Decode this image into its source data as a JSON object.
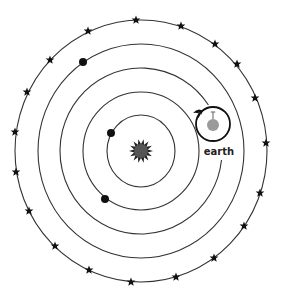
{
  "diagram": {
    "center": {
      "x": 141,
      "y": 151
    },
    "colors": {
      "line": "#333333",
      "star": "#111111",
      "sun": "#555555",
      "earth_planet": "#9a9a9a",
      "background": "#ffffff"
    },
    "earth_label": "earth",
    "orbits": [
      {
        "name": "orbit-1",
        "rx": 34,
        "ry": 36
      },
      {
        "name": "orbit-2",
        "rx": 58,
        "ry": 59
      },
      {
        "name": "orbit-3-earth",
        "rx": 81,
        "ry": 83,
        "gap": true
      },
      {
        "name": "orbit-4",
        "rx": 103,
        "ry": 107
      },
      {
        "name": "orbit-5-stars",
        "rx": 126,
        "ry": 131
      }
    ],
    "planets": [
      {
        "x": 111,
        "y": 133,
        "orbit": 1
      },
      {
        "x": 105,
        "y": 199,
        "orbit": 2
      },
      {
        "x": 83,
        "y": 62,
        "orbit": 4
      }
    ],
    "stars": [
      [
        136,
        20
      ],
      [
        181,
        26
      ],
      [
        215,
        44
      ],
      [
        237,
        64
      ],
      [
        255,
        98
      ],
      [
        266,
        143
      ],
      [
        260,
        193
      ],
      [
        244,
        226
      ],
      [
        214,
        258
      ],
      [
        176,
        277
      ],
      [
        131,
        282
      ],
      [
        89,
        270
      ],
      [
        55,
        246
      ],
      [
        29,
        211
      ],
      [
        16,
        172
      ],
      [
        15,
        132
      ],
      [
        27,
        92
      ],
      [
        50,
        60
      ],
      [
        88,
        31
      ]
    ],
    "earth": {
      "x": 213,
      "y": 124,
      "r": 17,
      "planet_r": 6
    }
  }
}
